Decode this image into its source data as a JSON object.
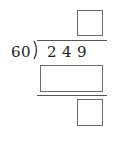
{
  "problem": {
    "type": "long-division",
    "divisor": "60",
    "dividend_digits": [
      "2",
      "4",
      "9"
    ],
    "quotient": "",
    "product": "",
    "remainder": ""
  },
  "colors": {
    "box_border": "#6b6b6b",
    "line": "#555555",
    "text": "#222222"
  }
}
